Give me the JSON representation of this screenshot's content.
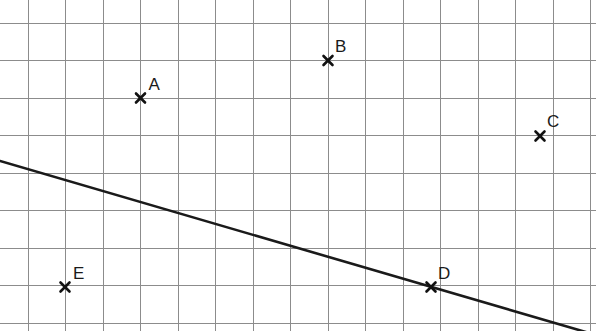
{
  "figure": {
    "title": "",
    "width": 596,
    "height": 331,
    "background_color": "#ffffff"
  },
  "grid": {
    "visible": true,
    "color": "#8c8c8c",
    "line_width": 1,
    "spacing_px": 37.5,
    "x_lines": [
      28,
      65.5,
      103,
      140.5,
      178,
      215.5,
      253,
      290.5,
      328,
      365.5,
      403,
      440.5,
      478,
      515.5,
      553,
      590.5
    ],
    "y_lines": [
      23,
      60.5,
      98,
      135.5,
      173,
      210.5,
      248,
      285.5,
      323
    ]
  },
  "chart_data": {
    "type": "scatter",
    "title": "",
    "xlabel": "",
    "ylabel": "",
    "grid": true,
    "legend": "none",
    "axis_units": "grid squares",
    "xlim": [
      0,
      596
    ],
    "ylim": [
      0,
      331
    ],
    "points": [
      {
        "label": "A",
        "px": 140.5,
        "py": 98,
        "grid_x": 3,
        "grid_y": 6,
        "marker": "x",
        "label_dx": 8,
        "label_dy": -22
      },
      {
        "label": "B",
        "px": 328,
        "py": 60.5,
        "grid_x": 8,
        "grid_y": 7,
        "marker": "x",
        "label_dx": 7,
        "label_dy": -23
      },
      {
        "label": "C",
        "px": 540,
        "py": 136,
        "grid_x": 13.65,
        "grid_y": 5,
        "marker": "x",
        "label_dx": 7,
        "label_dy": -23
      },
      {
        "label": "D",
        "px": 431,
        "py": 287,
        "grid_x": 10.75,
        "grid_y": 1,
        "marker": "x",
        "label_dx": 7,
        "label_dy": -22
      },
      {
        "label": "E",
        "px": 65,
        "py": 287,
        "grid_x": 1,
        "grid_y": 1,
        "marker": "x",
        "label_dx": 8,
        "label_dy": -22
      }
    ],
    "marker_color": "#111111",
    "marker_size": 9,
    "line": {
      "name": "trend-line",
      "color": "#1a1a1a",
      "width": 2.6,
      "x1": 0,
      "y1": 161,
      "x2": 596,
      "y2": 335,
      "slope_px": -0.292,
      "passes_through": [
        "D"
      ]
    }
  }
}
